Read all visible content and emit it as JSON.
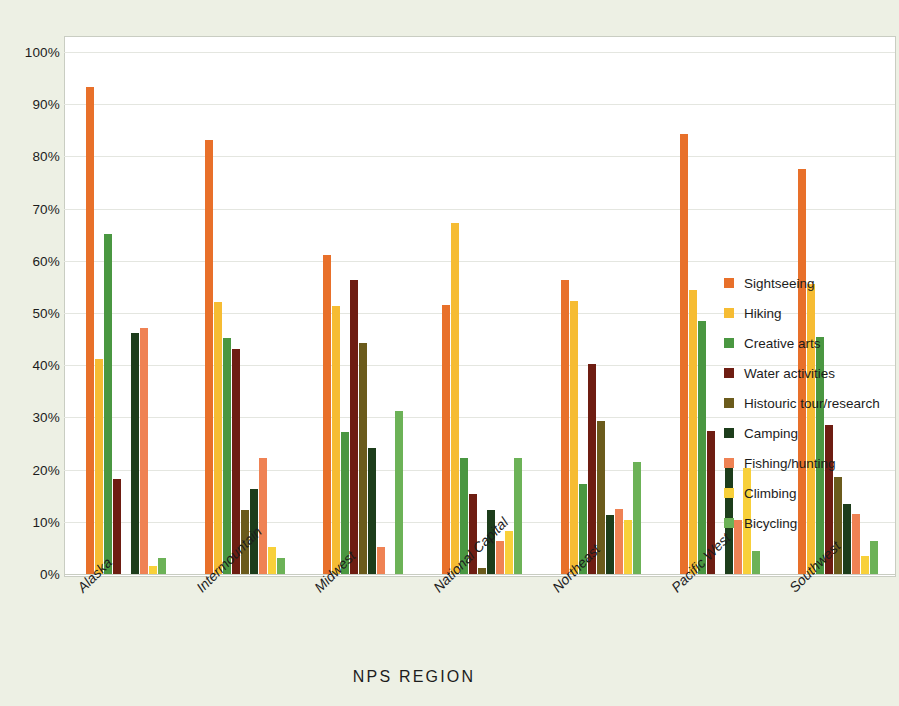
{
  "chart_data": {
    "type": "bar",
    "title": "",
    "subtitle": "",
    "xlabel": "NPS REGION",
    "ylabel": "",
    "ylim": [
      0,
      100
    ],
    "ytick_labels": [
      "0%",
      "10%",
      "20%",
      "30%",
      "40%",
      "50%",
      "60%",
      "70%",
      "80%",
      "90%",
      "100%"
    ],
    "ytick_values": [
      0,
      10,
      20,
      30,
      40,
      50,
      60,
      70,
      80,
      90,
      100
    ],
    "grid": true,
    "legend_position": "right",
    "categories": [
      "Alaska",
      "Intermountain",
      "Midwest",
      "National Capital",
      "Northeast",
      "Pacific West",
      "Southwest"
    ],
    "series": [
      {
        "name": "Sightseeing",
        "color": "#e8702a",
        "values": [
          93.3,
          83.1,
          61.2,
          51.5,
          56.4,
          84.2,
          77.5
        ]
      },
      {
        "name": "Hiking",
        "color": "#f6bc33",
        "values": [
          41.2,
          52.2,
          51.3,
          67.3,
          52.3,
          54.4,
          55.5
        ]
      },
      {
        "name": "Creative arts",
        "color": "#4a9741",
        "values": [
          65.1,
          45.2,
          27.2,
          22.3,
          17.3,
          48.4,
          45.5
        ]
      },
      {
        "name": "Water activities",
        "color": "#6e1d12",
        "values": [
          18.2,
          43.2,
          56.3,
          15.3,
          40.3,
          27.4,
          28.5
        ]
      },
      {
        "name": "Histouric tour/research",
        "color": "#6b5b1c",
        "values": [
          0.0,
          12.2,
          44.3,
          1.1,
          29.3,
          0.0,
          18.5
        ]
      },
      {
        "name": "Camping",
        "color": "#1d3d1b",
        "values": [
          46.1,
          16.2,
          24.2,
          12.3,
          11.3,
          20.4,
          13.5
        ]
      },
      {
        "name": "Fishing/hunting",
        "color": "#ef8254",
        "values": [
          47.1,
          22.2,
          5.2,
          6.3,
          12.5,
          10.4,
          11.5
        ]
      },
      {
        "name": "Climbing",
        "color": "#f8d03a",
        "values": [
          1.6,
          5.1,
          0.0,
          8.3,
          10.4,
          20.4,
          3.4
        ]
      },
      {
        "name": "Bicycling",
        "color": "#6cb257",
        "values": [
          3.0,
          3.1,
          31.3,
          22.3,
          21.4,
          4.4,
          6.3
        ]
      }
    ]
  },
  "legend": {
    "items": [
      {
        "label": "Sightseeing",
        "color": "#e8702a"
      },
      {
        "label": "Hiking",
        "color": "#f6bc33"
      },
      {
        "label": "Creative arts",
        "color": "#4a9741"
      },
      {
        "label": "Water activities",
        "color": "#6e1d12"
      },
      {
        "label": "Histouric tour/research",
        "color": "#6b5b1c"
      },
      {
        "label": "Camping",
        "color": "#1d3d1b"
      },
      {
        "label": "Fishing/hunting",
        "color": "#ef8254"
      },
      {
        "label": "Climbing",
        "color": "#f8d03a"
      },
      {
        "label": "Bicycling",
        "color": "#6cb257"
      }
    ]
  },
  "colors": {
    "page_background": "#edf0e4",
    "plot_background": "#ffffff",
    "gridline": "#e4e6e0",
    "frame": "#c9cdc2",
    "text": "#1c1c1c"
  }
}
